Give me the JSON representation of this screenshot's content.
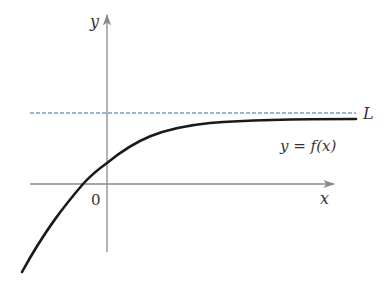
{
  "diagram": {
    "axes": {
      "x_label": "x",
      "y_label": "y",
      "origin_label": "0"
    },
    "asymptote": {
      "label": "L",
      "style": "dashed",
      "color": "#3a6e9e"
    },
    "curve": {
      "label": "y = f(x)",
      "color": "#1a1a1a"
    },
    "axis_color": "#8a8a8a"
  }
}
